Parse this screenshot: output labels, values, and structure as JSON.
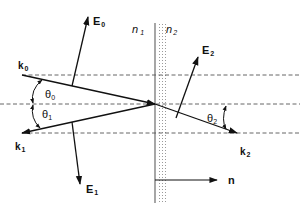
{
  "figure": {
    "media": {
      "n1_label": "n",
      "n1_sub": "1",
      "n2_label": "n",
      "n2_sub": "2"
    },
    "vectors": {
      "k0": {
        "label": "k",
        "sub": "0"
      },
      "k1": {
        "label": "k",
        "sub": "1"
      },
      "k2": {
        "label": "k",
        "sub": "2"
      },
      "E0": {
        "label": "E",
        "sub": "0"
      },
      "E1": {
        "label": "E",
        "sub": "1"
      },
      "E2": {
        "label": "E",
        "sub": "2"
      },
      "n": {
        "label": "n"
      }
    },
    "angles": {
      "theta0": {
        "label": "θ",
        "sub": "0"
      },
      "theta1": {
        "label": "θ",
        "sub": "1"
      },
      "theta2": {
        "label": "θ",
        "sub": "2"
      }
    },
    "colors": {
      "ink": "#111111",
      "dash": "#555555",
      "interface": "#888888",
      "dots": "#999999"
    }
  }
}
